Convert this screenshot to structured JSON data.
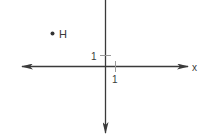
{
  "diagram": {
    "type": "coordinate-plane",
    "axes": {
      "x_label": "x",
      "x_tick_label": "1",
      "y_tick_label": "1"
    },
    "points": [
      {
        "label": "H",
        "x": -5,
        "y": 3
      }
    ],
    "colors": {
      "axis": "#3a3a3a",
      "tick": "#9a9a9a",
      "point": "#333333"
    }
  }
}
